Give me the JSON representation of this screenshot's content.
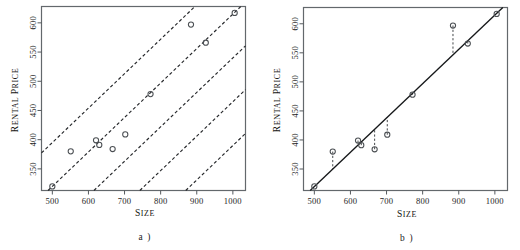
{
  "figure": {
    "background": "#ffffff",
    "panels": [
      {
        "id": "a",
        "caption": "a )",
        "chart_ref": 0
      },
      {
        "id": "b",
        "caption": "b )",
        "chart_ref": 1
      }
    ]
  },
  "chart_data": [
    {
      "type": "scatter",
      "title": "",
      "xlabel": "Size",
      "ylabel": "Rental Price",
      "xlim": [
        470,
        1035
      ],
      "ylim": [
        313,
        628
      ],
      "xticks": [
        500,
        600,
        700,
        800,
        900,
        1000
      ],
      "yticks": [
        350,
        400,
        450,
        500,
        550,
        600
      ],
      "xticklabels": [
        "500",
        "600",
        "700",
        "800",
        "900",
        "1000"
      ],
      "yticklabels": [
        "350",
        "400",
        "450",
        "500",
        "550",
        "600"
      ],
      "grid": false,
      "legend": "none",
      "marker": "open-circle",
      "points": [
        {
          "x": 500,
          "y": 320
        },
        {
          "x": 551,
          "y": 380
        },
        {
          "x": 621,
          "y": 399
        },
        {
          "x": 630,
          "y": 391
        },
        {
          "x": 667,
          "y": 384
        },
        {
          "x": 702,
          "y": 409
        },
        {
          "x": 772,
          "y": 478
        },
        {
          "x": 884,
          "y": 597
        },
        {
          "x": 925,
          "y": 566
        },
        {
          "x": 1005,
          "y": 617
        }
      ],
      "lines": {
        "style": "dashed",
        "slope": 0.59,
        "intercepts": [
          100,
          25,
          -50,
          -125,
          -200
        ],
        "description": "five parallel dashed candidate regression lines of equal slope"
      }
    },
    {
      "type": "scatter",
      "title": "",
      "xlabel": "Size",
      "ylabel": "Rental Price",
      "xlim": [
        470,
        1035
      ],
      "ylim": [
        313,
        628
      ],
      "xticks": [
        500,
        600,
        700,
        800,
        900,
        1000
      ],
      "yticks": [
        350,
        400,
        450,
        500,
        550,
        600
      ],
      "xticklabels": [
        "500",
        "600",
        "700",
        "800",
        "900",
        "1000"
      ],
      "yticklabels": [
        "350",
        "400",
        "450",
        "500",
        "550",
        "600"
      ],
      "grid": false,
      "legend": "none",
      "marker": "open-circle",
      "points": [
        {
          "x": 500,
          "y": 320
        },
        {
          "x": 551,
          "y": 380
        },
        {
          "x": 621,
          "y": 399
        },
        {
          "x": 630,
          "y": 391
        },
        {
          "x": 667,
          "y": 384
        },
        {
          "x": 702,
          "y": 409
        },
        {
          "x": 772,
          "y": 478
        },
        {
          "x": 884,
          "y": 597
        },
        {
          "x": 925,
          "y": 566
        },
        {
          "x": 1005,
          "y": 617
        }
      ],
      "fit_line": {
        "style": "solid",
        "slope": 0.5905,
        "intercept": 24.5,
        "description": "least-squares regression line"
      },
      "residuals": {
        "style": "dashed-vertical",
        "description": "vertical dashed segments from each point to the fitted line"
      }
    }
  ]
}
